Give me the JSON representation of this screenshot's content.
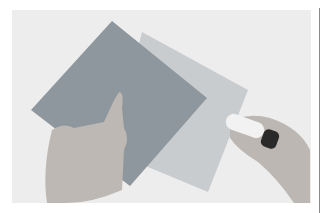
{
  "image": {
    "description": "Two hands placing a blue-grey square of paper over a lighter square of paper while holding a glue stick",
    "colors": {
      "background": "#ededed",
      "dark_paper": "#8e979d",
      "light_paper": "#c9cccf",
      "skin": "#b8b3ae",
      "glue_stick_body": "#f2f2f2",
      "glue_stick_cap": "#2a2a2a",
      "divider": "#8a8a8a"
    }
  }
}
